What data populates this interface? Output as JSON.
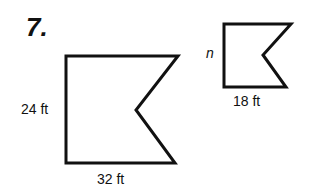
{
  "problem": {
    "number": "7."
  },
  "large_figure": {
    "side_label": "24 ft",
    "bottom_label": "32 ft",
    "points": "66,56 178,56 136,110 175,163 66,163"
  },
  "small_figure": {
    "side_label": "n",
    "bottom_label": "18 ft",
    "points": "224,24 291,24 263,55 286,87 224,87"
  },
  "colors": {
    "stroke": "#111111",
    "background": "#ffffff"
  }
}
